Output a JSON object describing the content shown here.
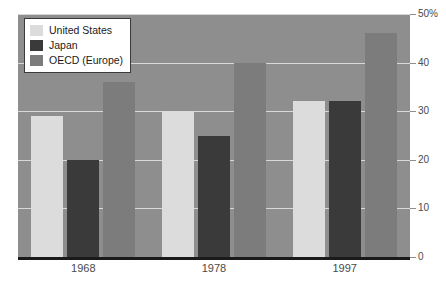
{
  "chart_data": {
    "type": "bar",
    "title": "",
    "subtitle": "",
    "xlabel": "",
    "ylabel": "",
    "categories": [
      "1968",
      "1978",
      "1997"
    ],
    "series": [
      {
        "name": "United States",
        "values": [
          29,
          30,
          32
        ],
        "color": "#dcdcdc"
      },
      {
        "name": "Japan",
        "values": [
          20,
          25,
          32
        ],
        "color": "#3a3a3a"
      },
      {
        "name": "OECD (Europe)",
        "values": [
          36,
          40,
          46
        ],
        "color": "#7c7c7c"
      }
    ],
    "ylim": [
      0,
      50
    ],
    "yticks": [
      0,
      10,
      20,
      30,
      40,
      50
    ],
    "ytick_labels": [
      "0",
      "10",
      "20",
      "30",
      "40",
      "50%"
    ],
    "yaxis_position": "right",
    "grid": true,
    "legend_position": "top-left",
    "unit": "%"
  },
  "colors": {
    "plot_background": "#8e8e8e",
    "gridline": "#d8d8d8",
    "axis": "#1a1a1a",
    "text": "#4a4a4a",
    "legend_border": "#3a3a3a",
    "legend_background": "#ffffff"
  }
}
